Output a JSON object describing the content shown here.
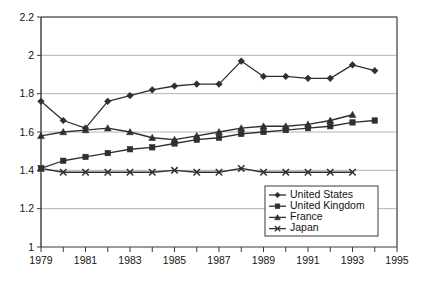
{
  "chart_data": {
    "type": "line",
    "title": "",
    "xlabel": "",
    "ylabel": "",
    "xlim": [
      1979,
      1995
    ],
    "ylim": [
      1,
      2.2
    ],
    "ytick_values": [
      1,
      1.2,
      1.4,
      1.6,
      1.8,
      2,
      2.2
    ],
    "ytick_labels": [
      "1",
      "1.2",
      "1.4",
      "1.6",
      "1.8",
      "2",
      "2.2"
    ],
    "xtick_values": [
      1979,
      1980,
      1981,
      1982,
      1983,
      1984,
      1985,
      1986,
      1987,
      1988,
      1989,
      1990,
      1991,
      1992,
      1993,
      1994,
      1995
    ],
    "xtick_labels_shown": [
      "1979",
      "1981",
      "1983",
      "1985",
      "1987",
      "1989",
      "1991",
      "1993",
      "1995"
    ],
    "grid": "horizontal",
    "legend_position": "bottom-right",
    "x": [
      1979,
      1980,
      1981,
      1982,
      1983,
      1984,
      1985,
      1986,
      1987,
      1988,
      1989,
      1990,
      1991,
      1992,
      1993,
      1994
    ],
    "series": [
      {
        "name": "United States",
        "marker": "diamond",
        "color": "#3c3c3c",
        "x": [
          1979,
          1980,
          1981,
          1982,
          1983,
          1984,
          1985,
          1986,
          1987,
          1988,
          1989,
          1990,
          1991,
          1992,
          1993,
          1994
        ],
        "values": [
          1.76,
          1.66,
          1.62,
          1.76,
          1.79,
          1.82,
          1.84,
          1.85,
          1.85,
          1.97,
          1.89,
          1.89,
          1.88,
          1.88,
          1.95,
          1.92
        ]
      },
      {
        "name": "United Kingdom",
        "marker": "square",
        "color": "#3c3c3c",
        "x": [
          1979,
          1980,
          1981,
          1982,
          1983,
          1984,
          1985,
          1986,
          1987,
          1988,
          1989,
          1990,
          1991,
          1992,
          1993,
          1994
        ],
        "values": [
          1.41,
          1.45,
          1.47,
          1.49,
          1.51,
          1.52,
          1.54,
          1.56,
          1.57,
          1.59,
          1.6,
          1.61,
          1.62,
          1.63,
          1.65,
          1.66
        ]
      },
      {
        "name": "France",
        "marker": "triangle",
        "color": "#3c3c3c",
        "x": [
          1979,
          1980,
          1981,
          1982,
          1983,
          1984,
          1985,
          1986,
          1987,
          1988,
          1989,
          1990,
          1991,
          1992,
          1993
        ],
        "values": [
          1.58,
          1.6,
          1.61,
          1.62,
          1.6,
          1.57,
          1.56,
          1.58,
          1.6,
          1.62,
          1.63,
          1.63,
          1.64,
          1.66,
          1.69
        ]
      },
      {
        "name": "Japan",
        "marker": "x",
        "color": "#3c3c3c",
        "x": [
          1979,
          1980,
          1981,
          1982,
          1983,
          1984,
          1985,
          1986,
          1987,
          1988,
          1989,
          1990,
          1991,
          1992,
          1993
        ],
        "values": [
          1.41,
          1.39,
          1.39,
          1.39,
          1.39,
          1.39,
          1.4,
          1.39,
          1.39,
          1.41,
          1.39,
          1.39,
          1.39,
          1.39,
          1.39
        ]
      }
    ]
  },
  "legend": {
    "items": [
      {
        "label": "United States",
        "marker": "diamond"
      },
      {
        "label": "United Kingdom",
        "marker": "square"
      },
      {
        "label": "France",
        "marker": "triangle"
      },
      {
        "label": "Japan",
        "marker": "x"
      }
    ]
  }
}
